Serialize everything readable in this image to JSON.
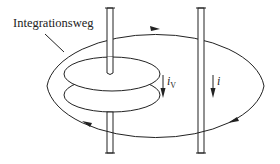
{
  "diagram": {
    "title": "",
    "path_label": "Integrationsweg",
    "currents": {
      "displacement": {
        "symbol": "i",
        "subscript": "V"
      },
      "conduction": {
        "symbol": "i",
        "subscript": ""
      }
    },
    "colors": {
      "line": "#222222",
      "background": "#ffffff"
    },
    "elements": [
      "integration-path-ellipse",
      "capacitor-plates",
      "left-wire",
      "right-wire",
      "displacement-current-arrow",
      "conduction-current-arrow"
    ]
  }
}
